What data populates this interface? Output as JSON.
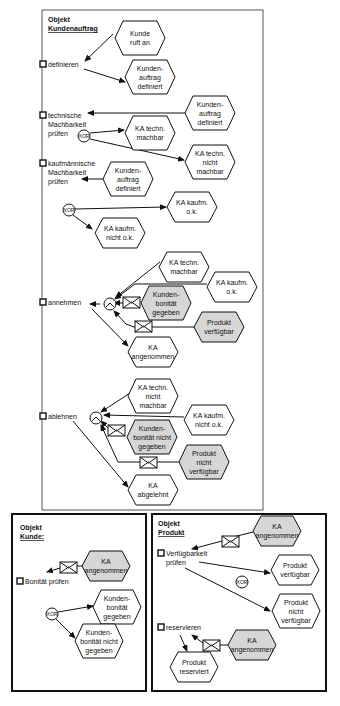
{
  "colors": {
    "event_white": "#ffffff",
    "event_grey": "#d6d6d6",
    "stroke": "#111111"
  },
  "main": {
    "object_label": "Objekt",
    "object_name": "Kundenauftrag",
    "functions": [
      {
        "id": "f1",
        "lines": [
          "definieren"
        ],
        "x": 40,
        "y": 66
      },
      {
        "id": "f2",
        "lines": [
          "technische",
          "Machbarkeit",
          "prüfen"
        ],
        "x": 40,
        "y": 117
      },
      {
        "id": "f3",
        "lines": [
          "kaufmännische",
          "Machbarkeit",
          "prüfen"
        ],
        "x": 40,
        "y": 165
      },
      {
        "id": "f4",
        "lines": [
          "annehmen"
        ],
        "x": 40,
        "y": 304
      },
      {
        "id": "f5",
        "lines": [
          "ablehnen"
        ],
        "x": 40,
        "y": 418
      }
    ],
    "events": [
      {
        "id": "e1",
        "lines": [
          "Kunde",
          "ruft an"
        ],
        "cx": 140,
        "cy": 38,
        "w": 50,
        "h": 34,
        "fill": "white"
      },
      {
        "id": "e2",
        "lines": [
          "Kunden-",
          "auftrag",
          "definiert"
        ],
        "cx": 150,
        "cy": 77,
        "w": 50,
        "h": 34,
        "fill": "white"
      },
      {
        "id": "e3",
        "lines": [
          "Kunden-",
          "auftrag",
          "definiert"
        ],
        "cx": 210,
        "cy": 113,
        "w": 50,
        "h": 34,
        "fill": "white"
      },
      {
        "id": "e4",
        "lines": [
          "KA techn.",
          "machbar"
        ],
        "cx": 150,
        "cy": 133,
        "w": 50,
        "h": 34,
        "fill": "white"
      },
      {
        "id": "e5",
        "lines": [
          "KA techn.",
          "nicht",
          "machbar"
        ],
        "cx": 210,
        "cy": 162,
        "w": 50,
        "h": 34,
        "fill": "white"
      },
      {
        "id": "e6",
        "lines": [
          "Kunden-",
          "auftrag",
          "definiert"
        ],
        "cx": 128,
        "cy": 179,
        "w": 50,
        "h": 34,
        "fill": "white"
      },
      {
        "id": "e7",
        "lines": [
          "KA kaufm.",
          "o.k."
        ],
        "cx": 192,
        "cy": 207,
        "w": 50,
        "h": 30,
        "fill": "white"
      },
      {
        "id": "e8",
        "lines": [
          "KA kaufm.",
          "nicht o.k."
        ],
        "cx": 120,
        "cy": 233,
        "w": 50,
        "h": 30,
        "fill": "white"
      },
      {
        "id": "e9",
        "lines": [
          "KA techn.",
          "machbar"
        ],
        "cx": 184,
        "cy": 267,
        "w": 50,
        "h": 30,
        "fill": "white"
      },
      {
        "id": "e10",
        "lines": [
          "KA kaufm.",
          "o.k."
        ],
        "cx": 232,
        "cy": 287,
        "w": 50,
        "h": 30,
        "fill": "white"
      },
      {
        "id": "e11",
        "lines": [
          "Kunden-",
          "bonität",
          "gegeben"
        ],
        "cx": 166,
        "cy": 303,
        "w": 50,
        "h": 34,
        "fill": "grey"
      },
      {
        "id": "e12",
        "lines": [
          "Produkt",
          "verfügbar"
        ],
        "cx": 219,
        "cy": 327,
        "w": 50,
        "h": 30,
        "fill": "grey"
      },
      {
        "id": "e13",
        "lines": [
          "KA",
          "angenommen"
        ],
        "cx": 153,
        "cy": 352,
        "w": 50,
        "h": 30,
        "fill": "white"
      },
      {
        "id": "e14",
        "lines": [
          "KA techn.",
          "nicht",
          "machbar"
        ],
        "cx": 153,
        "cy": 396,
        "w": 50,
        "h": 34,
        "fill": "white"
      },
      {
        "id": "e15",
        "lines": [
          "KA kaufm.",
          "nicht o.k."
        ],
        "cx": 209,
        "cy": 420,
        "w": 50,
        "h": 30,
        "fill": "white"
      },
      {
        "id": "e16",
        "lines": [
          "Kunden-",
          "bonität nicht",
          "gegeben"
        ],
        "cx": 152,
        "cy": 437,
        "w": 50,
        "h": 34,
        "fill": "grey"
      },
      {
        "id": "e17",
        "lines": [
          "Produkt",
          "nicht",
          "verfügbar"
        ],
        "cx": 204,
        "cy": 462,
        "w": 50,
        "h": 34,
        "fill": "grey"
      },
      {
        "id": "e18",
        "lines": [
          "KA",
          "abgelehnt"
        ],
        "cx": 153,
        "cy": 490,
        "w": 50,
        "h": 30,
        "fill": "white"
      }
    ],
    "connectors": [
      {
        "id": "c1",
        "label": "XOR",
        "cx": 84,
        "cy": 136
      },
      {
        "id": "c2",
        "label": "XOR",
        "cx": 69,
        "cy": 210
      },
      {
        "id": "c3",
        "label": "AND",
        "cx": 110,
        "cy": 304
      },
      {
        "id": "c4",
        "label": "AND",
        "cx": 96,
        "cy": 418
      }
    ]
  },
  "kunde": {
    "object_label": "Objekt",
    "object_name": "Kunde:",
    "functions": [
      {
        "id": "k1",
        "lines": [
          "Bonität prüfen"
        ],
        "x": 17,
        "y": 583
      }
    ],
    "events": [
      {
        "id": "ke1",
        "lines": [
          "KA",
          "angenommen"
        ],
        "cx": 106,
        "cy": 566,
        "w": 48,
        "h": 30,
        "fill": "grey"
      },
      {
        "id": "ke2",
        "lines": [
          "Kunden-",
          "bonität",
          "gegeben"
        ],
        "cx": 117,
        "cy": 607,
        "w": 48,
        "h": 34,
        "fill": "white"
      },
      {
        "id": "ke3",
        "lines": [
          "Kunden-",
          "bonität nicht",
          "gegeben"
        ],
        "cx": 99,
        "cy": 641,
        "w": 48,
        "h": 34,
        "fill": "white"
      }
    ],
    "connectors": [
      {
        "id": "kc1",
        "label": "XOR",
        "cx": 52,
        "cy": 614
      }
    ]
  },
  "produkt": {
    "object_label": "Objekt",
    "object_name": "Produkt",
    "functions": [
      {
        "id": "p1",
        "lines": [
          "Verfügbarkeit",
          "prüfen"
        ],
        "x": 158,
        "y": 555
      },
      {
        "id": "p2",
        "lines": [
          "reservieren"
        ],
        "x": 158,
        "y": 629
      }
    ],
    "events": [
      {
        "id": "pe1",
        "lines": [
          "KA",
          "angenommen"
        ],
        "cx": 277,
        "cy": 531,
        "w": 48,
        "h": 30,
        "fill": "grey"
      },
      {
        "id": "pe2",
        "lines": [
          "Produkt",
          "verfügbar"
        ],
        "cx": 295,
        "cy": 570,
        "w": 48,
        "h": 30,
        "fill": "white"
      },
      {
        "id": "pe3",
        "lines": [
          "Produkt",
          "nicht",
          "verfügbar"
        ],
        "cx": 296,
        "cy": 611,
        "w": 48,
        "h": 34,
        "fill": "white"
      },
      {
        "id": "pe4",
        "lines": [
          "KA",
          "angenommen"
        ],
        "cx": 252,
        "cy": 645,
        "w": 48,
        "h": 30,
        "fill": "grey"
      },
      {
        "id": "pe5",
        "lines": [
          "Produkt",
          "reserviert"
        ],
        "cx": 194,
        "cy": 667,
        "w": 48,
        "h": 30,
        "fill": "white"
      }
    ],
    "connectors": [
      {
        "id": "pc1",
        "label": "XOR",
        "cx": 242,
        "cy": 582
      }
    ]
  }
}
